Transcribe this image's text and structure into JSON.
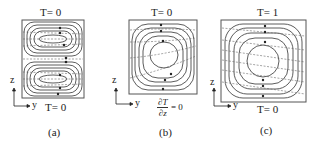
{
  "figure": {
    "panels": [
      {
        "id": "a",
        "caption": "(a)",
        "top_bc": "T= 0",
        "bottom_bc": "T= 0",
        "cells": 2,
        "axes": {
          "vertical": "z",
          "horizontal": "y"
        }
      },
      {
        "id": "b",
        "caption": "(b)",
        "top_bc": "T= 0",
        "bottom_bc_numerator": "∂T",
        "bottom_bc_denominator": "∂z",
        "bottom_bc_rhs": "= 0",
        "cells": 1,
        "axes": {
          "vertical": "z",
          "horizontal": "y"
        }
      },
      {
        "id": "c",
        "caption": "(c)",
        "top_bc": "T= 1",
        "bottom_bc": "T= 0",
        "cells": 1,
        "axes": {
          "vertical": "z",
          "horizontal": "y"
        }
      }
    ],
    "colors": {
      "box": "#555555",
      "streamline": "#333333",
      "isotherm": "#666666",
      "text": "#222222"
    }
  }
}
